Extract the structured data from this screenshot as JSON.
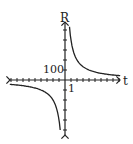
{
  "chart_data": {
    "type": "line",
    "title": "",
    "xlabel": "t",
    "ylabel": "R",
    "x_tick_label": "1",
    "y_tick_label": "100",
    "x_tick_unit": 1,
    "y_tick_unit": 100,
    "xlim": [
      -9,
      9
    ],
    "ylim": [
      -550,
      550
    ],
    "function": "R = k / t",
    "k_estimate": 400,
    "series": [
      {
        "name": "right branch",
        "x": [
          0.75,
          1,
          1.5,
          2,
          3,
          4,
          6,
          9
        ],
        "values": [
          533,
          400,
          267,
          200,
          133,
          100,
          67,
          44
        ]
      },
      {
        "name": "left branch",
        "x": [
          -9,
          -6,
          -4,
          -3,
          -2,
          -1.5,
          -1,
          -0.75
        ],
        "values": [
          -44,
          -67,
          -100,
          -133,
          -200,
          -267,
          -400,
          -533
        ]
      }
    ],
    "grid": false,
    "legend": "none"
  },
  "labels": {
    "y_axis": "R",
    "x_axis": "t",
    "y_tick": "100",
    "x_tick": "1"
  }
}
